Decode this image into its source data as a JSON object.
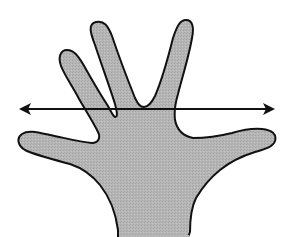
{
  "diagram": {
    "title": "Hand with horizontal double-headed arrow",
    "colors": {
      "background": "#ffffff",
      "hand_fill": "#b4b4b4",
      "outline": "#111111",
      "arrow": "#111111"
    },
    "elements": [
      {
        "id": "hand",
        "type": "shape",
        "description": "open hand, palm facing viewer, fingers spread"
      },
      {
        "id": "arrow",
        "type": "double-headed-arrow",
        "orientation": "horizontal",
        "y": 109,
        "x_start": 19,
        "x_end": 274
      }
    ]
  }
}
